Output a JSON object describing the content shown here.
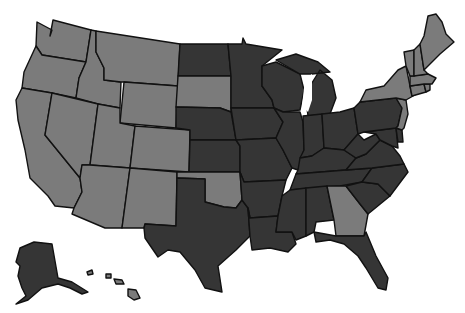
{
  "map": {
    "title": "United States choropleth map",
    "colors": {
      "light": "#7b7b7b",
      "dark": "#353535",
      "border": "#111111",
      "background": "#ffffff"
    },
    "categories": [
      {
        "id": "light",
        "label": "Category A (light gray)"
      },
      {
        "id": "dark",
        "label": "Category B (dark gray)"
      }
    ],
    "states": {
      "WA": "light",
      "OR": "light",
      "CA": "light",
      "ID": "light",
      "NV": "light",
      "MT": "light",
      "WY": "light",
      "UT": "light",
      "AZ": "light",
      "CO": "light",
      "NM": "light",
      "SD": "light",
      "OK": "light",
      "GA": "light",
      "NY": "light",
      "VT": "light",
      "NH": "light",
      "ME": "light",
      "MA": "light",
      "CT": "light",
      "RI": "light",
      "NJ": "light",
      "HI": "light",
      "ND": "dark",
      "NE": "dark",
      "KS": "dark",
      "TX": "dark",
      "MN": "dark",
      "IA": "dark",
      "MO": "dark",
      "AR": "dark",
      "LA": "dark",
      "WI": "dark",
      "IL": "dark",
      "MI": "dark",
      "IN": "dark",
      "OH": "dark",
      "KY": "dark",
      "TN": "dark",
      "MS": "dark",
      "AL": "dark",
      "FL": "dark",
      "SC": "dark",
      "NC": "dark",
      "VA": "dark",
      "WV": "dark",
      "PA": "dark",
      "MD": "dark",
      "DE": "dark",
      "AK": "dark"
    }
  }
}
